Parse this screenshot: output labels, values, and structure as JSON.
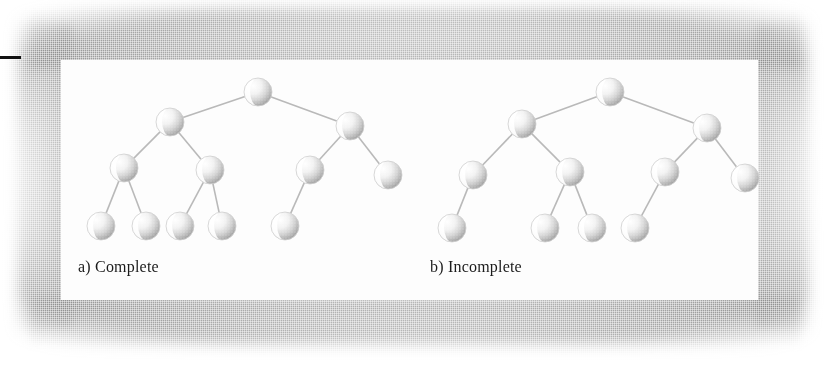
{
  "figure": {
    "kind": "binary-tree-comparison-figure",
    "background_color": "#ffffff",
    "plate_color": "#fdfdfd",
    "scan_shadow_color": "#808080",
    "node_fill_light": "#ffffff",
    "node_fill_shadow": "#a8a8a8",
    "edge_color": "#b9b9b9",
    "rule_color": "#111111",
    "caption_color": "#1b1b1b"
  },
  "captions": {
    "left": "a) Complete",
    "right": "b) Incomplete"
  },
  "trees": [
    {
      "id": "complete-tree",
      "label": "a) Complete",
      "node_radius": 14,
      "nodes": [
        {
          "id": "a-root",
          "cx": 258,
          "cy": 92,
          "level": 0
        },
        {
          "id": "a-l",
          "cx": 170,
          "cy": 122,
          "level": 1
        },
        {
          "id": "a-r",
          "cx": 350,
          "cy": 126,
          "level": 1
        },
        {
          "id": "a-ll",
          "cx": 124,
          "cy": 168,
          "level": 2
        },
        {
          "id": "a-lr",
          "cx": 210,
          "cy": 170,
          "level": 2
        },
        {
          "id": "a-rl",
          "cx": 310,
          "cy": 170,
          "level": 2
        },
        {
          "id": "a-rr",
          "cx": 388,
          "cy": 175,
          "level": 2
        },
        {
          "id": "a-lll",
          "cx": 101,
          "cy": 226,
          "level": 3
        },
        {
          "id": "a-llr",
          "cx": 146,
          "cy": 226,
          "level": 3
        },
        {
          "id": "a-lrl",
          "cx": 180,
          "cy": 226,
          "level": 3
        },
        {
          "id": "a-lrr",
          "cx": 222,
          "cy": 226,
          "level": 3
        },
        {
          "id": "a-rll",
          "cx": 285,
          "cy": 226,
          "level": 3
        }
      ],
      "edges": [
        [
          "a-root",
          "a-l"
        ],
        [
          "a-root",
          "a-r"
        ],
        [
          "a-l",
          "a-ll"
        ],
        [
          "a-l",
          "a-lr"
        ],
        [
          "a-r",
          "a-rl"
        ],
        [
          "a-r",
          "a-rr"
        ],
        [
          "a-ll",
          "a-lll"
        ],
        [
          "a-ll",
          "a-llr"
        ],
        [
          "a-lr",
          "a-lrl"
        ],
        [
          "a-lr",
          "a-lrr"
        ],
        [
          "a-rl",
          "a-rll"
        ]
      ],
      "node_count": 12
    },
    {
      "id": "incomplete-tree",
      "label": "b) Incomplete",
      "node_radius": 14,
      "nodes": [
        {
          "id": "b-root",
          "cx": 610,
          "cy": 92,
          "level": 0
        },
        {
          "id": "b-l",
          "cx": 522,
          "cy": 124,
          "level": 1
        },
        {
          "id": "b-r",
          "cx": 707,
          "cy": 128,
          "level": 1
        },
        {
          "id": "b-ll",
          "cx": 473,
          "cy": 175,
          "level": 2
        },
        {
          "id": "b-lr",
          "cx": 570,
          "cy": 172,
          "level": 2
        },
        {
          "id": "b-rl",
          "cx": 665,
          "cy": 172,
          "level": 2
        },
        {
          "id": "b-rr",
          "cx": 745,
          "cy": 178,
          "level": 2
        },
        {
          "id": "b-lll",
          "cx": 452,
          "cy": 228,
          "level": 3
        },
        {
          "id": "b-lrl",
          "cx": 545,
          "cy": 228,
          "level": 3
        },
        {
          "id": "b-lrr",
          "cx": 592,
          "cy": 228,
          "level": 3
        },
        {
          "id": "b-rll",
          "cx": 635,
          "cy": 228,
          "level": 3
        }
      ],
      "edges": [
        [
          "b-root",
          "b-l"
        ],
        [
          "b-root",
          "b-r"
        ],
        [
          "b-l",
          "b-ll"
        ],
        [
          "b-l",
          "b-lr"
        ],
        [
          "b-r",
          "b-rl"
        ],
        [
          "b-r",
          "b-rr"
        ],
        [
          "b-ll",
          "b-lll"
        ],
        [
          "b-lr",
          "b-lrl"
        ],
        [
          "b-lr",
          "b-lrr"
        ],
        [
          "b-rl",
          "b-rll"
        ]
      ],
      "node_count": 11
    }
  ]
}
